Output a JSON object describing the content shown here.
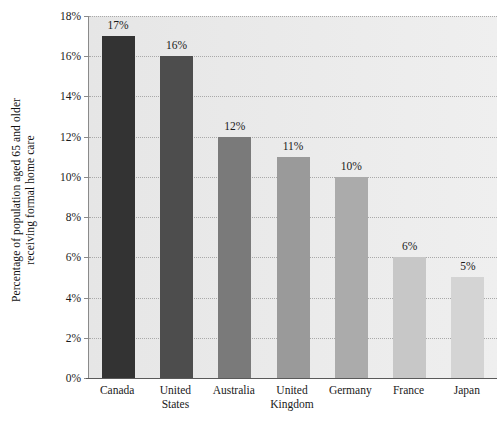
{
  "chart_data": {
    "type": "bar",
    "title": "",
    "subtitle": "",
    "xlabel": "",
    "ylabel": "Percentage of population aged 65 and older receiving formal home care",
    "ylabel_lines": [
      "Percentage of population aged 65 and older",
      "receiving formal home care"
    ],
    "categories": [
      "Canada",
      "United States",
      "Australia",
      "United Kingdom",
      "Germany",
      "France",
      "Japan"
    ],
    "category_lines": [
      [
        "Canada"
      ],
      [
        "United",
        "States"
      ],
      [
        "Australia"
      ],
      [
        "United",
        "Kingdom"
      ],
      [
        "Germany"
      ],
      [
        "France"
      ],
      [
        "Japan"
      ]
    ],
    "values": [
      17,
      16,
      12,
      11,
      10,
      6,
      5
    ],
    "data_labels": [
      "17%",
      "16%",
      "12%",
      "11%",
      "10%",
      "6%",
      "5%"
    ],
    "bar_colors": [
      "#333333",
      "#4d4d4d",
      "#7a7a7a",
      "#9a9a9a",
      "#ababab",
      "#c7c7c7",
      "#d4d4d4"
    ],
    "ylim": [
      0,
      18
    ],
    "ytick_values": [
      0,
      2,
      4,
      6,
      8,
      10,
      12,
      14,
      16,
      18
    ],
    "ytick_labels": [
      "0%",
      "2%",
      "4%",
      "6%",
      "8%",
      "10%",
      "12%",
      "14%",
      "16%",
      "18%"
    ],
    "grid": true,
    "grid_axis": "y",
    "legend": false,
    "legend_position": "none",
    "plot_background": "#e9e9e9",
    "figure_background": "#ffffff",
    "gridline_color": "#a9a9a9",
    "axis_color": "#5a5a5a",
    "text_color": "#1a1a1a"
  }
}
